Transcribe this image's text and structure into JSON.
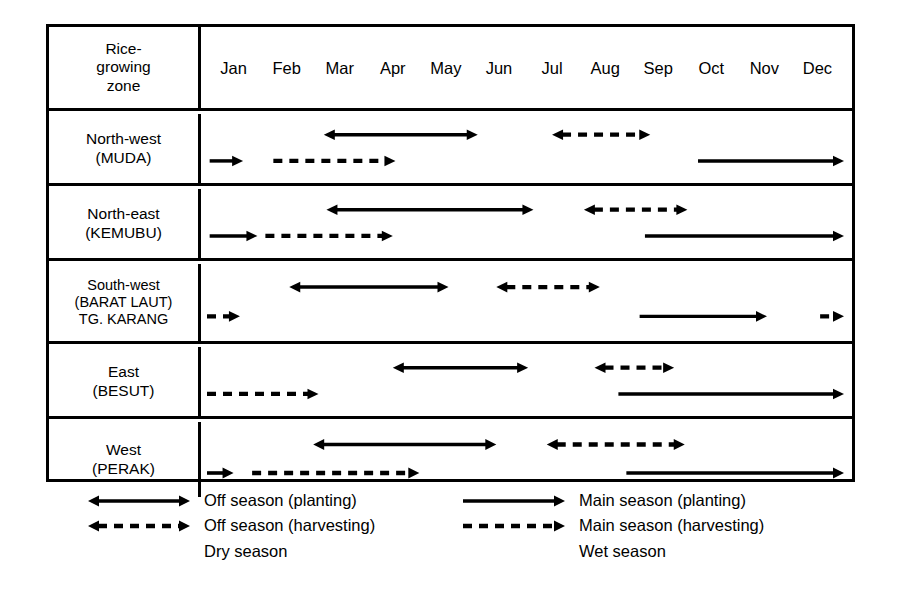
{
  "table": {
    "header": {
      "zone_label_lines": [
        "Rice-",
        "growing",
        "zone"
      ],
      "months": [
        "Jan",
        "Feb",
        "Mar",
        "Apr",
        "May",
        "Jun",
        "Jul",
        "Aug",
        "Sep",
        "Oct",
        "Nov",
        "Dec"
      ]
    },
    "rows": [
      {
        "id": "north-west",
        "zone_lines": [
          "North-west",
          "(MUDA)"
        ],
        "bars": [
          {
            "name": "off-season-planting",
            "style": "solid",
            "heads": "both",
            "lane": "upper",
            "start": 2.2,
            "end": 5.1
          },
          {
            "name": "off-season-harvesting",
            "style": "dashed",
            "heads": "both",
            "lane": "upper",
            "start": 6.5,
            "end": 8.35
          },
          {
            "name": "main-season-planting-early",
            "style": "solid",
            "heads": "right",
            "lane": "lower",
            "start": 0.05,
            "end": 0.68
          },
          {
            "name": "main-season-harvesting",
            "style": "dashed",
            "heads": "right",
            "lane": "lower",
            "start": 1.25,
            "end": 3.55
          },
          {
            "name": "main-season-planting",
            "style": "solid",
            "heads": "right",
            "lane": "lower",
            "start": 9.25,
            "end": 12.0
          }
        ]
      },
      {
        "id": "north-east",
        "zone_lines": [
          "North-east",
          "(KEMUBU)"
        ],
        "bars": [
          {
            "name": "off-season-planting",
            "style": "solid",
            "heads": "both",
            "lane": "upper",
            "start": 2.25,
            "end": 6.15
          },
          {
            "name": "off-season-harvesting",
            "style": "dashed",
            "heads": "both",
            "lane": "upper",
            "start": 7.1,
            "end": 9.05
          },
          {
            "name": "main-season-planting-early",
            "style": "solid",
            "heads": "right",
            "lane": "lower",
            "start": 0.05,
            "end": 0.95
          },
          {
            "name": "main-season-harvesting",
            "style": "dashed",
            "heads": "right",
            "lane": "lower",
            "start": 1.1,
            "end": 3.5
          },
          {
            "name": "main-season-planting",
            "style": "solid",
            "heads": "right",
            "lane": "lower",
            "start": 8.25,
            "end": 12.0
          }
        ]
      },
      {
        "id": "south-west",
        "zone_lines": [
          "South-west",
          "(BARAT LAUT)",
          "TG. KARANG"
        ],
        "bars": [
          {
            "name": "off-season-planting",
            "style": "solid",
            "heads": "both",
            "lane": "upper",
            "start": 1.55,
            "end": 4.55
          },
          {
            "name": "off-season-harvesting",
            "style": "dashed",
            "heads": "both",
            "lane": "upper",
            "start": 5.45,
            "end": 7.4
          },
          {
            "name": "main-season-harvesting-early",
            "style": "dashed",
            "heads": "right",
            "lane": "lower",
            "start": 0.0,
            "end": 0.62
          },
          {
            "name": "main-season-planting",
            "style": "solid",
            "heads": "right",
            "lane": "lower",
            "start": 8.15,
            "end": 10.55
          },
          {
            "name": "main-season-harvesting-late",
            "style": "dashed",
            "heads": "right",
            "lane": "lower",
            "start": 11.55,
            "end": 12.0
          }
        ]
      },
      {
        "id": "east",
        "zone_lines": [
          "East",
          "(BESUT)"
        ],
        "bars": [
          {
            "name": "off-season-planting",
            "style": "solid",
            "heads": "both",
            "lane": "upper",
            "start": 3.5,
            "end": 6.05
          },
          {
            "name": "off-season-harvesting",
            "style": "dashed",
            "heads": "both",
            "lane": "upper",
            "start": 7.3,
            "end": 8.8
          },
          {
            "name": "main-season-harvesting",
            "style": "dashed",
            "heads": "right",
            "lane": "lower",
            "start": 0.0,
            "end": 2.1
          },
          {
            "name": "main-season-planting",
            "style": "solid",
            "heads": "right",
            "lane": "lower",
            "start": 7.75,
            "end": 12.0
          }
        ]
      },
      {
        "id": "west",
        "zone_lines": [
          "West",
          "(PERAK)"
        ],
        "bars": [
          {
            "name": "off-season-planting",
            "style": "solid",
            "heads": "both",
            "lane": "upper",
            "start": 2.0,
            "end": 5.45
          },
          {
            "name": "off-season-harvesting",
            "style": "dashed",
            "heads": "both",
            "lane": "upper",
            "start": 6.4,
            "end": 9.0
          },
          {
            "name": "main-season-planting-early",
            "style": "solid",
            "heads": "right",
            "lane": "lower",
            "start": 0.0,
            "end": 0.5
          },
          {
            "name": "main-season-harvesting",
            "style": "dashed",
            "heads": "right",
            "lane": "lower",
            "start": 0.85,
            "end": 4.0
          },
          {
            "name": "main-season-planting",
            "style": "solid",
            "heads": "right",
            "lane": "lower",
            "start": 7.9,
            "end": 12.0
          }
        ]
      }
    ]
  },
  "legend": {
    "left": {
      "items": [
        {
          "style": "solid",
          "heads": "both",
          "label": "Off season (planting)"
        },
        {
          "style": "dashed",
          "heads": "both",
          "label": "Off season (harvesting)"
        }
      ],
      "season": "Dry season"
    },
    "right": {
      "items": [
        {
          "style": "solid",
          "heads": "right",
          "label": "Main season (planting)"
        },
        {
          "style": "dashed",
          "heads": "right",
          "label": "Main season (harvesting)"
        }
      ],
      "season": "Wet season"
    }
  },
  "chart_data": {
    "type": "table",
    "categories": [
      "Jan",
      "Feb",
      "Mar",
      "Apr",
      "May",
      "Jun",
      "Jul",
      "Aug",
      "Sep",
      "Oct",
      "Nov",
      "Dec"
    ],
    "xlabel": "Month",
    "ylabel": "Rice-growing zone",
    "xlim": [
      0,
      12
    ],
    "grid": false,
    "legend_position": "below-table",
    "series": [
      {
        "name": "North-west (MUDA)",
        "activities": [
          {
            "activity": "Off season (planting)",
            "season": "Dry",
            "from_month": "Mar",
            "to_month": "May",
            "start": 2.2,
            "end": 5.1
          },
          {
            "activity": "Off season (harvesting)",
            "season": "Dry",
            "from_month": "Jul",
            "to_month": "Sep",
            "start": 6.5,
            "end": 8.35
          },
          {
            "activity": "Main season (planting)",
            "season": "Wet",
            "from_month": "Jan",
            "to_month": "Jan",
            "start": 0.05,
            "end": 0.68
          },
          {
            "activity": "Main season (harvesting)",
            "season": "Wet",
            "from_month": "Feb",
            "to_month": "Apr",
            "start": 1.25,
            "end": 3.55
          },
          {
            "activity": "Main season (planting)",
            "season": "Wet",
            "from_month": "Oct",
            "to_month": "Dec",
            "start": 9.25,
            "end": 12.0
          }
        ]
      },
      {
        "name": "North-east (KEMUBU)",
        "activities": [
          {
            "activity": "Off season (planting)",
            "season": "Dry",
            "from_month": "Mar",
            "to_month": "Jul",
            "start": 2.25,
            "end": 6.15
          },
          {
            "activity": "Off season (harvesting)",
            "season": "Dry",
            "from_month": "Aug",
            "to_month": "Sep",
            "start": 7.1,
            "end": 9.05
          },
          {
            "activity": "Main season (planting)",
            "season": "Wet",
            "from_month": "Jan",
            "to_month": "Jan",
            "start": 0.05,
            "end": 0.95
          },
          {
            "activity": "Main season (harvesting)",
            "season": "Wet",
            "from_month": "Feb",
            "to_month": "Apr",
            "start": 1.1,
            "end": 3.5
          },
          {
            "activity": "Main season (planting)",
            "season": "Wet",
            "from_month": "Sep",
            "to_month": "Dec",
            "start": 8.25,
            "end": 12.0
          }
        ]
      },
      {
        "name": "South-west (BARAT LAUT) TG. KARANG",
        "activities": [
          {
            "activity": "Off season (planting)",
            "season": "Dry",
            "from_month": "Feb",
            "to_month": "May",
            "start": 1.55,
            "end": 4.55
          },
          {
            "activity": "Off season (harvesting)",
            "season": "Dry",
            "from_month": "Jun",
            "to_month": "Aug",
            "start": 5.45,
            "end": 7.4
          },
          {
            "activity": "Main season (harvesting)",
            "season": "Wet",
            "from_month": "Jan",
            "to_month": "Jan",
            "start": 0.0,
            "end": 0.62
          },
          {
            "activity": "Main season (planting)",
            "season": "Wet",
            "from_month": "Sep",
            "to_month": "Nov",
            "start": 8.15,
            "end": 10.55
          },
          {
            "activity": "Main season (harvesting)",
            "season": "Wet",
            "from_month": "Dec",
            "to_month": "Dec",
            "start": 11.55,
            "end": 12.0
          }
        ]
      },
      {
        "name": "East (BESUT)",
        "activities": [
          {
            "activity": "Off season (planting)",
            "season": "Dry",
            "from_month": "Apr",
            "to_month": "Jul",
            "start": 3.5,
            "end": 6.05
          },
          {
            "activity": "Off season (harvesting)",
            "season": "Dry",
            "from_month": "Aug",
            "to_month": "Sep",
            "start": 7.3,
            "end": 8.8
          },
          {
            "activity": "Main season (harvesting)",
            "season": "Wet",
            "from_month": "Jan",
            "to_month": "Mar",
            "start": 0.0,
            "end": 2.1
          },
          {
            "activity": "Main season (planting)",
            "season": "Wet",
            "from_month": "Sep",
            "to_month": "Dec",
            "start": 7.75,
            "end": 12.0
          }
        ]
      },
      {
        "name": "West (PERAK)",
        "activities": [
          {
            "activity": "Off season (planting)",
            "season": "Dry",
            "from_month": "Mar",
            "to_month": "Jun",
            "start": 2.0,
            "end": 5.45
          },
          {
            "activity": "Off season (harvesting)",
            "season": "Dry",
            "from_month": "Jul",
            "to_month": "Sep",
            "start": 6.4,
            "end": 9.0
          },
          {
            "activity": "Main season (planting)",
            "season": "Wet",
            "from_month": "Jan",
            "to_month": "Jan",
            "start": 0.0,
            "end": 0.5
          },
          {
            "activity": "Main season (harvesting)",
            "season": "Wet",
            "from_month": "Jan",
            "to_month": "May",
            "start": 0.85,
            "end": 4.0
          },
          {
            "activity": "Main season (planting)",
            "season": "Wet",
            "from_month": "Sep",
            "to_month": "Dec",
            "start": 7.9,
            "end": 12.0
          }
        ]
      }
    ],
    "legend_entries": [
      "Off season (planting)",
      "Off season (harvesting)",
      "Dry season",
      "Main season (planting)",
      "Main season (harvesting)",
      "Wet season"
    ]
  }
}
